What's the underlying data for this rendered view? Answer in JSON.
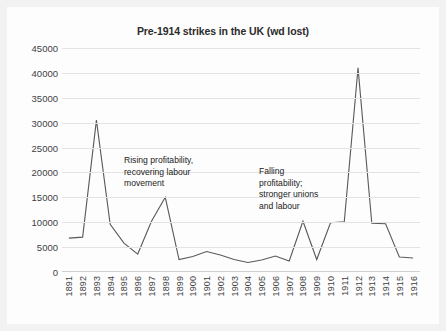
{
  "chart_data": {
    "type": "line",
    "title": "Pre-1914 strikes in the UK (wd lost)",
    "xlabel": "",
    "ylabel": "",
    "ylim": [
      0,
      45000
    ],
    "ytick_step": 5000,
    "yticks": [
      "0",
      "5000",
      "10000",
      "15000",
      "20000",
      "25000",
      "30000",
      "35000",
      "40000",
      "45000"
    ],
    "grid": true,
    "legend": "none",
    "categories": [
      "1891",
      "1892",
      "1893",
      "1894",
      "1895",
      "1896",
      "1897",
      "1898",
      "1899",
      "1900",
      "1901",
      "1902",
      "1903",
      "1904",
      "1905",
      "1906",
      "1907",
      "1908",
      "1909",
      "1910",
      "1911",
      "1912",
      "1913",
      "1914",
      "1915",
      "1916"
    ],
    "values": [
      6800,
      7000,
      30500,
      9600,
      5800,
      3600,
      10200,
      15000,
      2500,
      3100,
      4100,
      3400,
      2500,
      1900,
      2400,
      3200,
      2200,
      10200,
      2500,
      9900,
      10100,
      41000,
      9800,
      9700,
      3000,
      2800
    ],
    "annotations": [
      {
        "id": "annotation-1",
        "text": "Rising profitability,\nrecovering labour\nmovement",
        "near_category": "1897"
      },
      {
        "id": "annotation-2",
        "text": "Falling\nprofitability;\nstronger unions\nand labour",
        "near_category": "1908"
      }
    ],
    "colors": {
      "line": "#595959",
      "gridline": "#e3e3e3",
      "axis": "#d0d0d0",
      "text": "#3f3f3f",
      "title": "#2b2b2b",
      "plot_background": "#fdfdfd",
      "outer_background": "#f2f2f2"
    }
  }
}
